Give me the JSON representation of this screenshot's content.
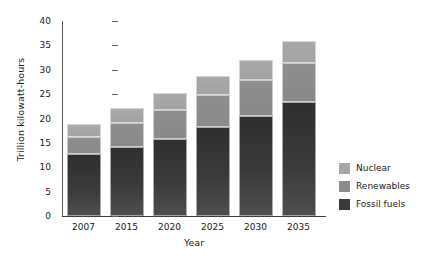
{
  "chart_data": {
    "type": "bar",
    "title": "",
    "subtitle": "",
    "stacked": true,
    "xlabel": "Year",
    "ylabel": "Trillion kilowatt-hours",
    "categories": [
      "2007",
      "2015",
      "2020",
      "2025",
      "2030",
      "2035"
    ],
    "ylim": [
      0,
      40
    ],
    "yticks": [
      0,
      5,
      10,
      15,
      20,
      25,
      30,
      35,
      40
    ],
    "ytick_labels": [
      "0",
      "5",
      "10",
      "15",
      "20",
      "25",
      "30",
      "35",
      "40"
    ],
    "grid": false,
    "legend_position": "right",
    "series": [
      {
        "name": "Fossil fuels",
        "color": "#3a3a3a",
        "values": [
          12.8,
          14.1,
          15.9,
          18.2,
          20.6,
          23.3
        ]
      },
      {
        "name": "Renewables",
        "color": "#8c8c8c",
        "values": [
          3.5,
          5.0,
          5.8,
          6.7,
          7.3,
          8.1
        ]
      },
      {
        "name": "Nuclear",
        "color": "#a6a6a6",
        "values": [
          2.5,
          3.0,
          3.6,
          3.8,
          4.2,
          4.5
        ]
      }
    ],
    "totals": [
      18.8,
      22.1,
      25.3,
      28.7,
      32.1,
      35.9
    ]
  },
  "legend": {
    "items": [
      {
        "label": "Nuclear",
        "color": "#a6a6a6"
      },
      {
        "label": "Renewables",
        "color": "#8c8c8c"
      },
      {
        "label": "Fossil fuels",
        "color": "#3a3a3a"
      }
    ]
  }
}
